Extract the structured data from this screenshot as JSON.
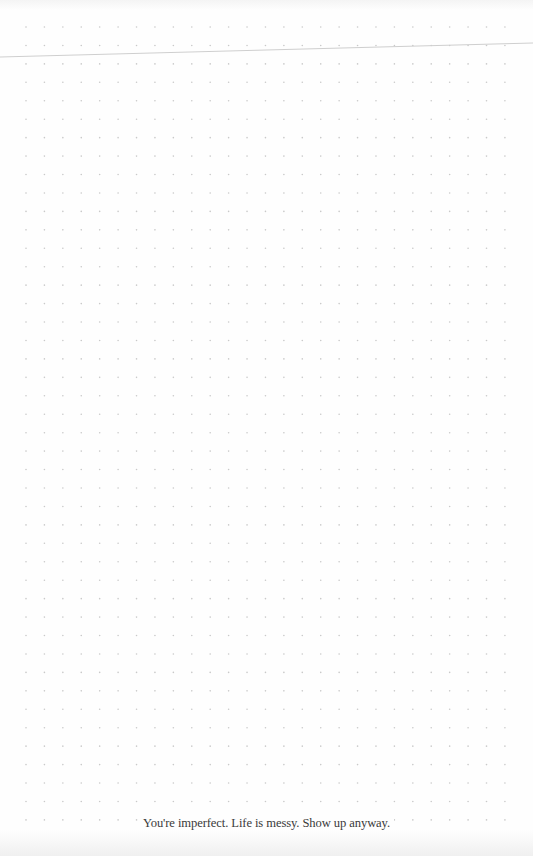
{
  "page": {
    "type": "dot-grid-notebook-page",
    "background_color": "#fefefe",
    "dot_color": "#c9c9c9",
    "grid": {
      "columns": 27,
      "rows": 44,
      "origin_x": 26,
      "origin_y": 27,
      "spacing_x": 18.42,
      "spacing_y": 18.44,
      "dot_radius": 0.8
    },
    "line": {
      "color": "#cfcfcf",
      "x1": 0,
      "y1": 57,
      "x2": 533,
      "y2": 43
    }
  },
  "footer": {
    "quote": "You're imperfect. Life is messy. Show up anyway."
  }
}
